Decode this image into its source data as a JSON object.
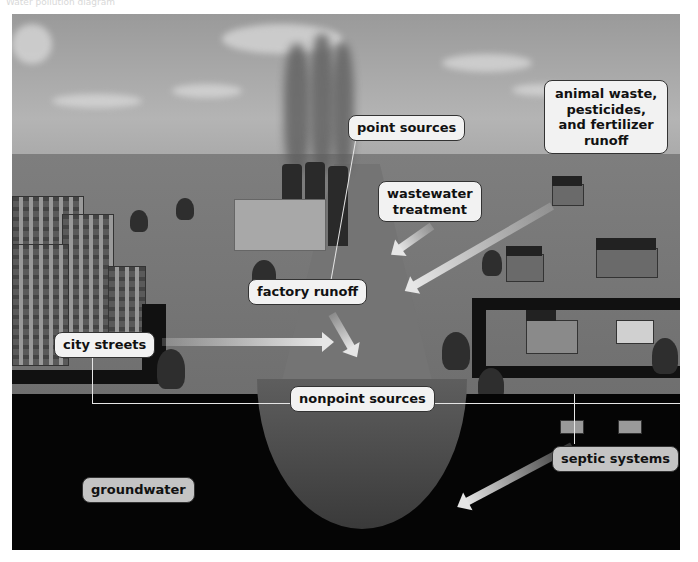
{
  "caption": "Water pollution diagram",
  "diagram": {
    "labels": {
      "point_sources": "point sources",
      "animal_waste": "animal waste,\npesticides,\nand fertilizer\nrunoff",
      "animal_waste_lines": [
        "animal waste,",
        "pesticides,",
        "and fertilizer",
        "runoff"
      ],
      "wastewater_treatment_lines": [
        "wastewater",
        "treatment"
      ],
      "factory_runoff": "factory runoff",
      "city_streets": "city streets",
      "nonpoint_sources": "nonpoint sources",
      "septic_systems": "septic systems",
      "groundwater": "groundwater"
    },
    "icons": [
      "factory-icon",
      "smokestack-icon",
      "city-buildings-icon",
      "farm-icon",
      "house-icon",
      "tree-icon",
      "arrow-icon",
      "river-icon",
      "septic-tank-icon"
    ],
    "colors": {
      "label_bg": "#f2f2f2",
      "label_border": "#333333",
      "underground": "#050505",
      "arrow": "#e6e6e6"
    }
  }
}
